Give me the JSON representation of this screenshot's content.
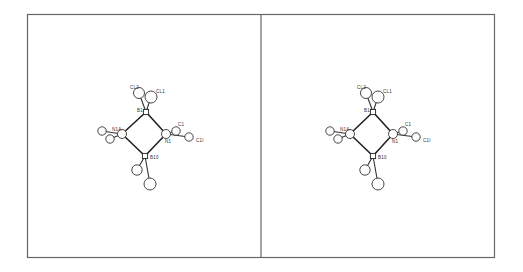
{
  "figure": {
    "type": "stereo-pair molecular structure (ORTEP-style)",
    "panels": [
      "left",
      "right"
    ],
    "atoms": [
      {
        "id": "B1",
        "label": "B1"
      },
      {
        "id": "CL2",
        "label": "CL2"
      },
      {
        "id": "CL1",
        "label": "CL1"
      },
      {
        "id": "N1A",
        "label": "N1A"
      },
      {
        "id": "N1",
        "label": "N1"
      },
      {
        "id": "B10",
        "label": "B10"
      },
      {
        "id": "C1",
        "label": "C1"
      },
      {
        "id": "C1I",
        "label": "C1I"
      },
      {
        "id": "SA",
        "label": ""
      },
      {
        "id": "SB",
        "label": ""
      },
      {
        "id": "SC",
        "label": ""
      },
      {
        "id": "SD",
        "label": ""
      }
    ],
    "bonds": [
      [
        "B1",
        "N1A"
      ],
      [
        "B1",
        "N1"
      ],
      [
        "N1A",
        "B10"
      ],
      [
        "N1",
        "B10"
      ],
      [
        "B1",
        "CL2"
      ],
      [
        "B1",
        "CL1"
      ],
      [
        "N1",
        "C1"
      ],
      [
        "N1",
        "C1I"
      ],
      [
        "N1A",
        "SA"
      ],
      [
        "N1A",
        "SB"
      ],
      [
        "B10",
        "SC"
      ],
      [
        "B10",
        "SD"
      ]
    ]
  }
}
